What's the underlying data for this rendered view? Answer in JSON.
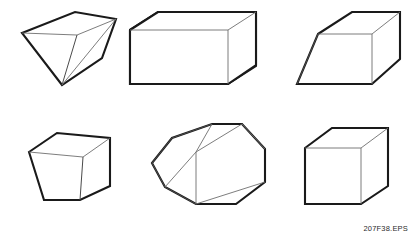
{
  "figure": {
    "caption": "207F38.EPS",
    "background_color": "#ffffff",
    "outline_color": "#1a1a1a",
    "inner_edge_color": "#6e6e6e",
    "rows": 2,
    "columns": 3,
    "shape_count": 6
  },
  "shapes": [
    {
      "index": 1,
      "name": "inverted-pyramid",
      "label": "Inverted quadrilateral pyramid",
      "row": 1,
      "column": 1,
      "faces_visible": 3,
      "description": "Four-sided top face tapering down to a single apex point at the bottom"
    },
    {
      "index": 2,
      "name": "rectangular-box",
      "label": "Rectangular box",
      "row": 1,
      "column": 2,
      "faces_visible": 3,
      "description": "Wide cuboid shown in three-quarter view with top, front and right faces"
    },
    {
      "index": 3,
      "name": "oblique-prism",
      "label": "Sheared oblique prism",
      "row": 1,
      "column": 3,
      "faces_visible": 3,
      "description": "Rhombohedron leaning to the left with parallelogram front face"
    },
    {
      "index": 4,
      "name": "tapered-frustum",
      "label": "Tapered frustum block",
      "row": 2,
      "column": 1,
      "faces_visible": 3,
      "description": "Box narrowing toward the bottom, trapezoidal front face"
    },
    {
      "index": 5,
      "name": "hexagonal-prism",
      "label": "Hexagonal prism",
      "row": 2,
      "column": 2,
      "faces_visible": 3,
      "description": "Six-sided prism angled diagonally with hexagonal end face at left"
    },
    {
      "index": 6,
      "name": "cube",
      "label": "Cube",
      "row": 2,
      "column": 3,
      "faces_visible": 3,
      "description": "Regular cube in three-quarter isometric view"
    }
  ]
}
